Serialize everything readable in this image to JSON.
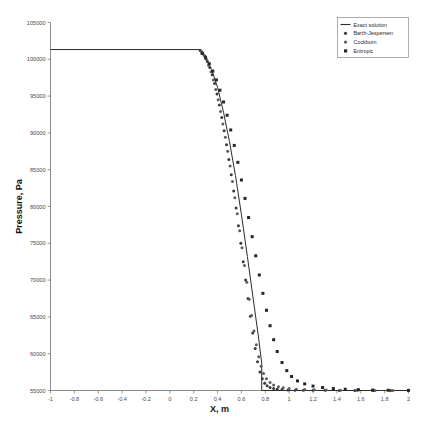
{
  "chart_data": {
    "type": "scatter",
    "title": "",
    "xlabel": "X, m",
    "ylabel": "Pressure, Pa",
    "xlim": [
      -1,
      2
    ],
    "ylim": [
      55000,
      105000
    ],
    "xticks": [
      -1,
      -0.8,
      -0.6,
      -0.4,
      -0.2,
      0,
      0.2,
      0.4,
      0.6,
      0.8,
      1,
      1.2,
      1.4,
      1.6,
      1.8,
      2
    ],
    "xtick_labels": [
      "-1",
      "-0.8",
      "-0.6",
      "-0.4",
      "-0.2",
      "0",
      "0.2",
      "0.4",
      "0.6",
      "0.8",
      "1",
      "1.2",
      "1.4",
      "1.6",
      "1.8",
      "2"
    ],
    "yticks": [
      55000,
      60000,
      65000,
      70000,
      75000,
      80000,
      85000,
      90000,
      95000,
      100000,
      105000
    ],
    "ytick_labels": [
      "55000",
      "60000",
      "65000",
      "70000",
      "75000",
      "80000",
      "85000",
      "90000",
      "95000",
      "100000",
      "105000"
    ],
    "grid": false,
    "legend_position": "top-right",
    "series": [
      {
        "name": "Exact solution",
        "type": "line",
        "color": "#2b2b2b",
        "points": [
          [
            -1.0,
            101325
          ],
          [
            0.26,
            101325
          ],
          [
            0.3,
            100100
          ],
          [
            0.35,
            98600
          ],
          [
            0.4,
            96200
          ],
          [
            0.45,
            92800
          ],
          [
            0.5,
            88800
          ],
          [
            0.55,
            84200
          ],
          [
            0.6,
            78900
          ],
          [
            0.65,
            73200
          ],
          [
            0.7,
            67300
          ],
          [
            0.74,
            62600
          ],
          [
            0.77,
            58700
          ],
          [
            0.77,
            55000
          ],
          [
            2.0,
            55000
          ]
        ]
      },
      {
        "name": "Barth-Jespersen",
        "type": "scatter",
        "color": "#3a3a3a",
        "marker": "circle",
        "points": [
          [
            0.255,
            101200
          ],
          [
            0.275,
            100900
          ],
          [
            0.295,
            100400
          ],
          [
            0.315,
            99700
          ],
          [
            0.335,
            98900
          ],
          [
            0.355,
            97900
          ],
          [
            0.375,
            96700
          ],
          [
            0.395,
            95300
          ],
          [
            0.415,
            93800
          ],
          [
            0.435,
            92100
          ],
          [
            0.455,
            90300
          ],
          [
            0.475,
            88400
          ],
          [
            0.495,
            86400
          ],
          [
            0.515,
            84300
          ],
          [
            0.535,
            82100
          ],
          [
            0.555,
            79800
          ],
          [
            0.575,
            77400
          ],
          [
            0.595,
            75000
          ],
          [
            0.615,
            72500
          ],
          [
            0.635,
            70000
          ],
          [
            0.655,
            67500
          ],
          [
            0.675,
            65100
          ],
          [
            0.695,
            62800
          ],
          [
            0.715,
            60700
          ],
          [
            0.735,
            58900
          ],
          [
            0.755,
            57500
          ],
          [
            0.775,
            56600
          ],
          [
            0.795,
            56000
          ],
          [
            0.815,
            55650
          ],
          [
            0.84,
            55420
          ],
          [
            0.87,
            55270
          ],
          [
            0.9,
            55180
          ],
          [
            0.94,
            55120
          ],
          [
            0.99,
            55080
          ],
          [
            1.05,
            55050
          ],
          [
            1.12,
            55035
          ],
          [
            1.2,
            55025
          ],
          [
            1.3,
            55018
          ],
          [
            1.42,
            55012
          ],
          [
            1.55,
            55008
          ],
          [
            1.7,
            55005
          ],
          [
            1.85,
            55003
          ],
          [
            2.0,
            55002
          ]
        ]
      },
      {
        "name": "Cockburn",
        "type": "scatter",
        "color": "#5c5c5c",
        "marker": "circle",
        "points": [
          [
            0.265,
            101050
          ],
          [
            0.285,
            100600
          ],
          [
            0.305,
            100000
          ],
          [
            0.325,
            99200
          ],
          [
            0.345,
            98300
          ],
          [
            0.365,
            97200
          ],
          [
            0.385,
            95900
          ],
          [
            0.405,
            94500
          ],
          [
            0.425,
            92900
          ],
          [
            0.445,
            91200
          ],
          [
            0.465,
            89400
          ],
          [
            0.485,
            87500
          ],
          [
            0.505,
            85500
          ],
          [
            0.525,
            83400
          ],
          [
            0.545,
            81200
          ],
          [
            0.565,
            79000
          ],
          [
            0.585,
            76700
          ],
          [
            0.605,
            74400
          ],
          [
            0.625,
            72000
          ],
          [
            0.645,
            69700
          ],
          [
            0.665,
            67400
          ],
          [
            0.685,
            65200
          ],
          [
            0.705,
            63100
          ],
          [
            0.725,
            61200
          ],
          [
            0.745,
            59600
          ],
          [
            0.765,
            58300
          ],
          [
            0.785,
            57300
          ],
          [
            0.81,
            56600
          ],
          [
            0.84,
            56080
          ],
          [
            0.87,
            55760
          ],
          [
            0.91,
            55520
          ],
          [
            0.95,
            55370
          ],
          [
            1.0,
            55260
          ],
          [
            1.06,
            55180
          ],
          [
            1.13,
            55125
          ],
          [
            1.21,
            55085
          ],
          [
            1.31,
            55055
          ],
          [
            1.43,
            55035
          ],
          [
            1.57,
            55020
          ],
          [
            1.72,
            55012
          ],
          [
            1.87,
            55007
          ],
          [
            2.0,
            55005
          ]
        ]
      },
      {
        "name": "Entropic",
        "type": "scatter",
        "color": "#252525",
        "marker": "square",
        "points": [
          [
            0.27,
            100800
          ],
          [
            0.3,
            100200
          ],
          [
            0.33,
            99400
          ],
          [
            0.36,
            98400
          ],
          [
            0.39,
            97200
          ],
          [
            0.42,
            95800
          ],
          [
            0.45,
            94200
          ],
          [
            0.48,
            92400
          ],
          [
            0.51,
            90400
          ],
          [
            0.54,
            88300
          ],
          [
            0.57,
            86000
          ],
          [
            0.6,
            83600
          ],
          [
            0.63,
            81100
          ],
          [
            0.66,
            78500
          ],
          [
            0.69,
            75900
          ],
          [
            0.72,
            73300
          ],
          [
            0.75,
            70700
          ],
          [
            0.78,
            68200
          ],
          [
            0.81,
            65900
          ],
          [
            0.84,
            63800
          ],
          [
            0.87,
            61900
          ],
          [
            0.9,
            60300
          ],
          [
            0.94,
            58800
          ],
          [
            0.98,
            57700
          ],
          [
            1.02,
            56900
          ],
          [
            1.07,
            56300
          ],
          [
            1.13,
            55900
          ],
          [
            1.2,
            55600
          ],
          [
            1.28,
            55400
          ],
          [
            1.37,
            55260
          ],
          [
            1.47,
            55170
          ],
          [
            1.58,
            55110
          ],
          [
            1.7,
            55065
          ],
          [
            1.83,
            55035
          ],
          [
            2.0,
            55015
          ]
        ]
      }
    ]
  },
  "legend": {
    "entries": [
      {
        "label": "Exact solution",
        "style": "line"
      },
      {
        "label": "Barth-Jespersen",
        "style": "marker"
      },
      {
        "label": "Cockburn",
        "style": "marker"
      },
      {
        "label": "Entropic",
        "style": "marker"
      }
    ]
  }
}
